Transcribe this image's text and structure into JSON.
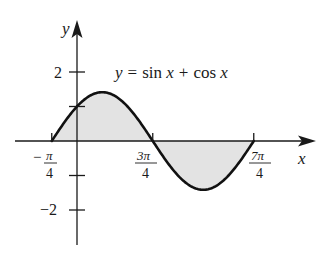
{
  "chart_data": {
    "type": "area",
    "equation": {
      "lhs": "y",
      "eq": "=",
      "term1": "sin x",
      "plus": "+",
      "term2": "cos x"
    },
    "xlabel": "x",
    "ylabel": "y",
    "x_ticks": [
      {
        "value": -0.7853981634,
        "label_num": "π",
        "label_den": "4",
        "sign": "−"
      },
      {
        "value": 2.3561944902,
        "label_num": "3π",
        "label_den": "4",
        "sign": ""
      },
      {
        "value": 5.4977871438,
        "label_num": "7π",
        "label_den": "4",
        "sign": ""
      }
    ],
    "y_ticks": [
      {
        "value": 2,
        "label": "2"
      },
      {
        "value": 1,
        "label": ""
      },
      {
        "value": -1,
        "label": ""
      },
      {
        "value": -2,
        "label": "−2"
      }
    ],
    "xlim": [
      -0.785,
      5.498
    ],
    "ylim": [
      -3,
      3.3
    ],
    "function": "sin(x) + cos(x)",
    "shaded_regions": [
      {
        "from": "-π/4",
        "to": "3π/4",
        "sign": "positive"
      },
      {
        "from": "3π/4",
        "to": "7π/4",
        "sign": "negative"
      }
    ],
    "key_points": [
      {
        "x": "-π/4",
        "y": 0
      },
      {
        "x": "0",
        "y": 1
      },
      {
        "x": "π/4",
        "y": 1.414
      },
      {
        "x": "3π/4",
        "y": 0
      },
      {
        "x": "5π/4",
        "y": -1.414
      },
      {
        "x": "7π/4",
        "y": 0
      }
    ],
    "grid": false,
    "legend": "none"
  },
  "colors": {
    "curve": "#111111",
    "axis": "#1a1a1a",
    "fill": "#e3e3e3",
    "background": "#ffffff"
  }
}
